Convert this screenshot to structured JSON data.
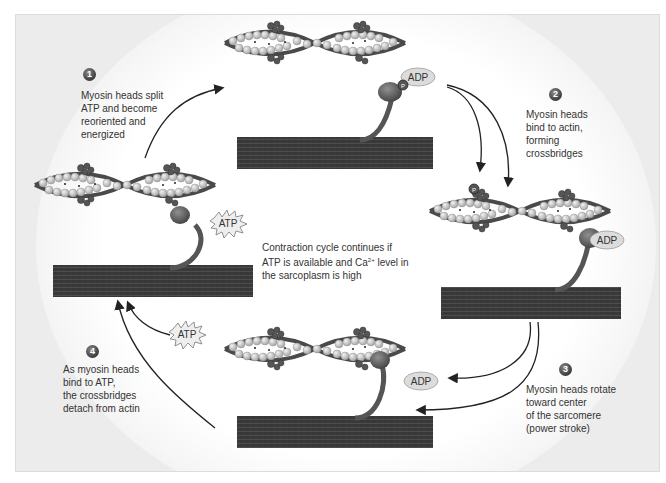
{
  "diagram": {
    "colors": {
      "background": "#ececec",
      "thick_filament": "#3a3a3a",
      "actin_bead": "#c8c8c8",
      "troponin": "#5a5a5a",
      "adp_fill": "#dcdcdc",
      "arrow": "#222222",
      "badge": "#4a4a4a",
      "text": "#333333"
    },
    "steps": [
      {
        "number": "1",
        "lines": [
          "Myosin heads split",
          "ATP and become",
          "reoriented and",
          "energized"
        ]
      },
      {
        "number": "2",
        "lines": [
          "Myosin heads",
          "bind to actin,",
          "forming",
          "crossbridges"
        ]
      },
      {
        "number": "3",
        "lines": [
          "Myosin heads rotate",
          "toward center",
          "of the sarcomere",
          "(power stroke)"
        ]
      },
      {
        "number": "4",
        "lines": [
          "As myosin heads",
          "bind to ATP,",
          "the crossbridges",
          "detach from actin"
        ]
      }
    ],
    "center_note": {
      "line1": "Contraction cycle continues if",
      "line2_a": "ATP is available and Ca",
      "line2_sup": "2+",
      "line2_b": " level in",
      "line3": "the sarcoplasm is high"
    },
    "molecule_labels": {
      "top_adp": "ADP",
      "top_pi": "P",
      "right_pi": "P",
      "right_adp": "ADP",
      "bottom_adp": "ADP",
      "left_atp": "ATP",
      "bottom_left_atp": "ATP"
    },
    "stages": [
      {
        "position": "top",
        "state": "energized head with ADP + Pi"
      },
      {
        "position": "right",
        "state": "crossbridge formed, Pi released"
      },
      {
        "position": "bottom",
        "state": "power stroke, ADP released"
      },
      {
        "position": "left",
        "state": "ATP bound, head detached"
      }
    ],
    "icons": [
      "step-badge-1",
      "step-badge-2",
      "step-badge-3",
      "step-badge-4",
      "atp-starburst-icon",
      "adp-ellipse-icon",
      "phosphate-circle-icon",
      "cycle-arrow-icon"
    ]
  }
}
